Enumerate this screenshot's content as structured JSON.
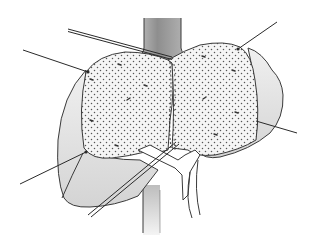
{
  "diagram": {
    "view": "posterior surface with inferior vena cava and porta hepatis",
    "labels": [],
    "colors": {
      "background": "#ffffff",
      "outline": "#3a3a3a",
      "lobe_shade": "#e2e2e2",
      "stipple_fill": "#f4f4f4",
      "stipple_dot": "#5a5a5a",
      "vessel_gray": "#9a9a9a"
    },
    "structures": [
      {
        "id": "ivc-upper",
        "name": "inferior vena cava (upper)"
      },
      {
        "id": "ivc-lower",
        "name": "inferior vena cava (lower)"
      },
      {
        "id": "right-lobe",
        "name": "right lobe"
      },
      {
        "id": "left-lobe",
        "name": "left lobe"
      },
      {
        "id": "stippled-area-left",
        "name": "stippled region left"
      },
      {
        "id": "stippled-area-right",
        "name": "stippled region right"
      },
      {
        "id": "portal-vessels",
        "name": "portal vein / hepatic artery bifurcation"
      }
    ],
    "leader_lines": [
      {
        "id": "leader-1",
        "x1": 23,
        "y1": 50,
        "x2": 88,
        "y2": 72,
        "double": false
      },
      {
        "id": "leader-2",
        "x1": 68,
        "y1": 29,
        "x2": 172,
        "y2": 58,
        "double": true
      },
      {
        "id": "leader-3",
        "x1": 277,
        "y1": 22,
        "x2": 238,
        "y2": 49,
        "double": false
      },
      {
        "id": "leader-4",
        "x1": 297,
        "y1": 133,
        "x2": 258,
        "y2": 121,
        "double": false
      },
      {
        "id": "leader-5",
        "x1": 20,
        "y1": 184,
        "x2": 86,
        "y2": 152,
        "double": false
      },
      {
        "id": "leader-6",
        "x1": 89,
        "y1": 216,
        "x2": 176,
        "y2": 143,
        "double": true
      }
    ]
  }
}
